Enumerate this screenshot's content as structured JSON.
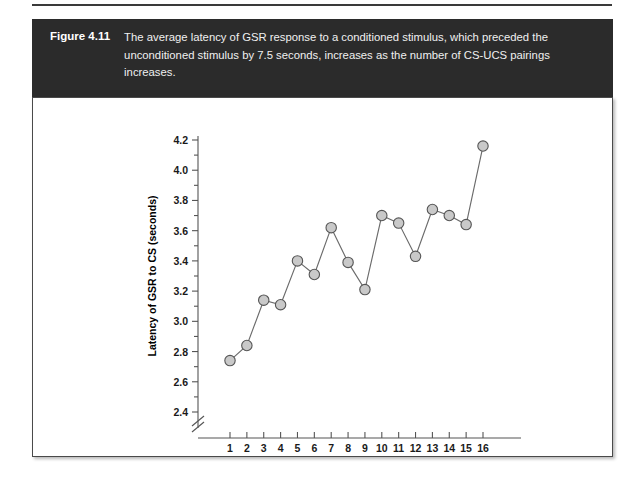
{
  "figure": {
    "number": "Figure 4.11",
    "caption": "The average latency of GSR response to a conditioned stimulus, which preceded the unconditioned stimulus by 7.5 seconds, increases as the number of CS-UCS pairings increases."
  },
  "colors": {
    "caption_bar": "#2b2b2b",
    "caption_text": "#f0f0f0",
    "marker_fill": "#c9c9c9",
    "marker_stroke": "#555555",
    "line": "#6b6b6b",
    "axis": "#555555",
    "panel_background": "#ffffff"
  },
  "chart_data": {
    "type": "line",
    "title": "",
    "xlabel": "Blocks of 3 acquisition trials",
    "ylabel": "Latency of GSR to CS (seconds)",
    "x": [
      1,
      2,
      3,
      4,
      5,
      6,
      7,
      8,
      9,
      10,
      11,
      12,
      13,
      14,
      15,
      16
    ],
    "values": [
      2.74,
      2.84,
      3.14,
      3.11,
      3.4,
      3.31,
      3.62,
      3.39,
      3.21,
      3.7,
      3.65,
      3.43,
      3.74,
      3.7,
      3.64,
      4.16
    ],
    "xtick_labels": [
      "1",
      "2",
      "3",
      "4",
      "5",
      "6",
      "7",
      "8",
      "9",
      "10",
      "11",
      "12",
      "13",
      "14",
      "15",
      "16"
    ],
    "ytick_labels": [
      "2.4",
      "2.6",
      "2.8",
      "3.0",
      "3.2",
      "3.4",
      "3.6",
      "3.8",
      "4.0",
      "4.2"
    ],
    "ytick_values": [
      2.4,
      2.6,
      2.8,
      3.0,
      3.2,
      3.4,
      3.6,
      3.8,
      4.0,
      4.2
    ],
    "ylim": [
      2.4,
      4.2
    ],
    "xlim": [
      1,
      16
    ],
    "grid": false,
    "legend": "none",
    "y_axis_break": true,
    "marker": "circle"
  }
}
